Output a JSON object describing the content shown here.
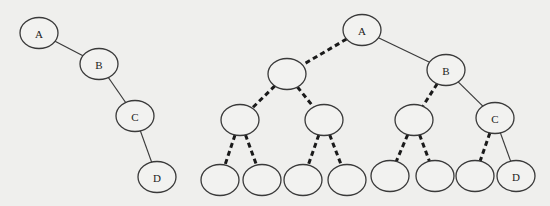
{
  "diagram": {
    "type": "binary-tree-comparison",
    "background": "#efefed",
    "stroke_color": "#3a3a3a",
    "left_tree": {
      "description": "Right-skewed binary tree",
      "nodes": [
        {
          "id": "L_A",
          "label": "A",
          "cx": 39,
          "cy": 33
        },
        {
          "id": "L_B",
          "label": "B",
          "cx": 99,
          "cy": 64
        },
        {
          "id": "L_C",
          "label": "C",
          "cx": 135,
          "cy": 116
        },
        {
          "id": "L_D",
          "label": "D",
          "cx": 157,
          "cy": 177
        }
      ],
      "edges": [
        {
          "from": "L_A",
          "to": "L_B",
          "style": "solid"
        },
        {
          "from": "L_B",
          "to": "L_C",
          "style": "solid"
        },
        {
          "from": "L_C",
          "to": "L_D",
          "style": "solid"
        }
      ]
    },
    "right_tree": {
      "description": "Same tree embedded in a complete binary tree; virtual nodes connected by dashed edges",
      "nodes": [
        {
          "id": "R_A",
          "label": "A",
          "cx": 362,
          "cy": 30
        },
        {
          "id": "R_1L",
          "label": "",
          "cx": 287,
          "cy": 74
        },
        {
          "id": "R_B",
          "label": "B",
          "cx": 446,
          "cy": 70
        },
        {
          "id": "R_2a",
          "label": "",
          "cx": 240,
          "cy": 120
        },
        {
          "id": "R_2b",
          "label": "",
          "cx": 324,
          "cy": 120
        },
        {
          "id": "R_2c",
          "label": "",
          "cx": 414,
          "cy": 120
        },
        {
          "id": "R_C",
          "label": "C",
          "cx": 495,
          "cy": 118
        },
        {
          "id": "R_3a",
          "label": "",
          "cx": 220,
          "cy": 180
        },
        {
          "id": "R_3b",
          "label": "",
          "cx": 262,
          "cy": 180
        },
        {
          "id": "R_3c",
          "label": "",
          "cx": 303,
          "cy": 180
        },
        {
          "id": "R_3d",
          "label": "",
          "cx": 347,
          "cy": 180
        },
        {
          "id": "R_3e",
          "label": "",
          "cx": 390,
          "cy": 176
        },
        {
          "id": "R_3f",
          "label": "",
          "cx": 435,
          "cy": 176
        },
        {
          "id": "R_3g",
          "label": "",
          "cx": 475,
          "cy": 176
        },
        {
          "id": "R_D",
          "label": "D",
          "cx": 516,
          "cy": 176
        }
      ],
      "edges": [
        {
          "from": "R_A",
          "to": "R_1L",
          "style": "dashed"
        },
        {
          "from": "R_A",
          "to": "R_B",
          "style": "solid"
        },
        {
          "from": "R_1L",
          "to": "R_2a",
          "style": "dashed"
        },
        {
          "from": "R_1L",
          "to": "R_2b",
          "style": "dashed"
        },
        {
          "from": "R_B",
          "to": "R_2c",
          "style": "dashed"
        },
        {
          "from": "R_B",
          "to": "R_C",
          "style": "solid"
        },
        {
          "from": "R_2a",
          "to": "R_3a",
          "style": "dashed"
        },
        {
          "from": "R_2a",
          "to": "R_3b",
          "style": "dashed"
        },
        {
          "from": "R_2b",
          "to": "R_3c",
          "style": "dashed"
        },
        {
          "from": "R_2b",
          "to": "R_3d",
          "style": "dashed"
        },
        {
          "from": "R_2c",
          "to": "R_3e",
          "style": "dashed"
        },
        {
          "from": "R_2c",
          "to": "R_3f",
          "style": "dashed"
        },
        {
          "from": "R_C",
          "to": "R_3g",
          "style": "dashed"
        },
        {
          "from": "R_C",
          "to": "R_D",
          "style": "solid"
        }
      ]
    },
    "node_rx": 19,
    "node_ry": 15.5
  }
}
